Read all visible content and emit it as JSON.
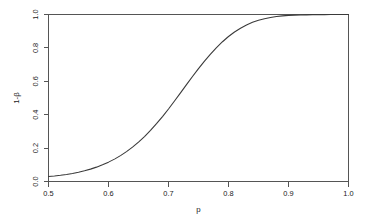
{
  "figure": {
    "background_color": "#ffffff",
    "axis_color": "#555555",
    "curve_color": "#3a3a3a"
  },
  "chart_data": {
    "type": "line",
    "title": "",
    "subtitle": "",
    "xlabel": "p",
    "ylabel": "1-β",
    "xlim": [
      0.5,
      1.0
    ],
    "ylim": [
      0.0,
      1.0
    ],
    "grid": false,
    "legend": null,
    "legend_position": "none",
    "xticks": [
      0.5,
      0.6,
      0.7,
      0.8,
      0.9,
      1.0
    ],
    "xtick_labels": [
      "0.5",
      "0.6",
      "0.7",
      "0.8",
      "0.9",
      "1.0"
    ],
    "yticks": [
      0.0,
      0.2,
      0.4,
      0.6,
      0.8,
      1.0
    ],
    "ytick_labels": [
      "0.0",
      "0.2",
      "0.4",
      "0.6",
      "0.8",
      "1.0"
    ],
    "series": [
      {
        "name": "power",
        "x": [
          0.5,
          0.51,
          0.52,
          0.53,
          0.54,
          0.55,
          0.56,
          0.57,
          0.58,
          0.59,
          0.6,
          0.61,
          0.62,
          0.63,
          0.64,
          0.65,
          0.66,
          0.67,
          0.68,
          0.69,
          0.7,
          0.71,
          0.72,
          0.73,
          0.74,
          0.75,
          0.76,
          0.77,
          0.78,
          0.79,
          0.8,
          0.81,
          0.82,
          0.83,
          0.84,
          0.85,
          0.86,
          0.87,
          0.88,
          0.89,
          0.9,
          0.91,
          0.92,
          0.93,
          0.94,
          0.95,
          0.96,
          0.97,
          0.98,
          0.99,
          1.0
        ],
        "y": [
          0.03,
          0.033,
          0.037,
          0.042,
          0.048,
          0.055,
          0.064,
          0.074,
          0.086,
          0.1,
          0.116,
          0.134,
          0.155,
          0.179,
          0.206,
          0.236,
          0.269,
          0.306,
          0.346,
          0.389,
          0.434,
          0.482,
          0.531,
          0.58,
          0.629,
          0.676,
          0.721,
          0.763,
          0.802,
          0.837,
          0.868,
          0.895,
          0.918,
          0.937,
          0.953,
          0.965,
          0.975,
          0.982,
          0.988,
          0.992,
          0.995,
          0.996,
          0.997,
          0.998,
          0.999,
          0.999,
          0.999,
          1.0,
          1.0,
          1.0,
          1.0
        ]
      }
    ]
  }
}
